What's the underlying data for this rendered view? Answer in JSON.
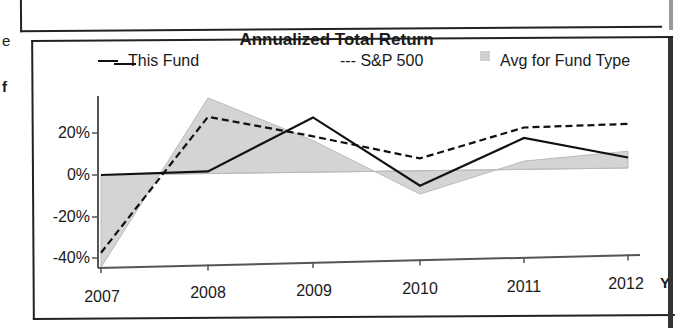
{
  "page_fragments": {
    "left_letter_1": "e",
    "left_letter_2": "f",
    "right_letter": "Y"
  },
  "chart_data": {
    "type": "line",
    "title": "Annualized Total Return",
    "xlabel": "Y",
    "ylabel": "",
    "categories": [
      "2007",
      "2008",
      "2009",
      "2010",
      "2011",
      "2012"
    ],
    "series": [
      {
        "name": "This Fund",
        "style": "solid",
        "values": [
          0,
          1,
          26,
          -7,
          15,
          5
        ]
      },
      {
        "name": "S&P 500",
        "style": "dashed",
        "values": [
          -37,
          27,
          17,
          6,
          20,
          21
        ]
      },
      {
        "name": "Avg for Fund Type",
        "style": "area",
        "values": [
          -44,
          36,
          15,
          -11,
          4,
          8
        ]
      }
    ],
    "yticks": [
      "20%",
      "0%",
      "-20%",
      "-40%"
    ],
    "ylim": [
      -45,
      40
    ],
    "grid": false,
    "legend_position": "top",
    "colors": {
      "fund": "#111111",
      "sp500": "#111111",
      "avg_fill": "#d4d4d4"
    }
  },
  "legend": {
    "fund_label": "This Fund",
    "sp_label": "--- S&P 500",
    "avg_label": "Avg for Fund Type"
  }
}
